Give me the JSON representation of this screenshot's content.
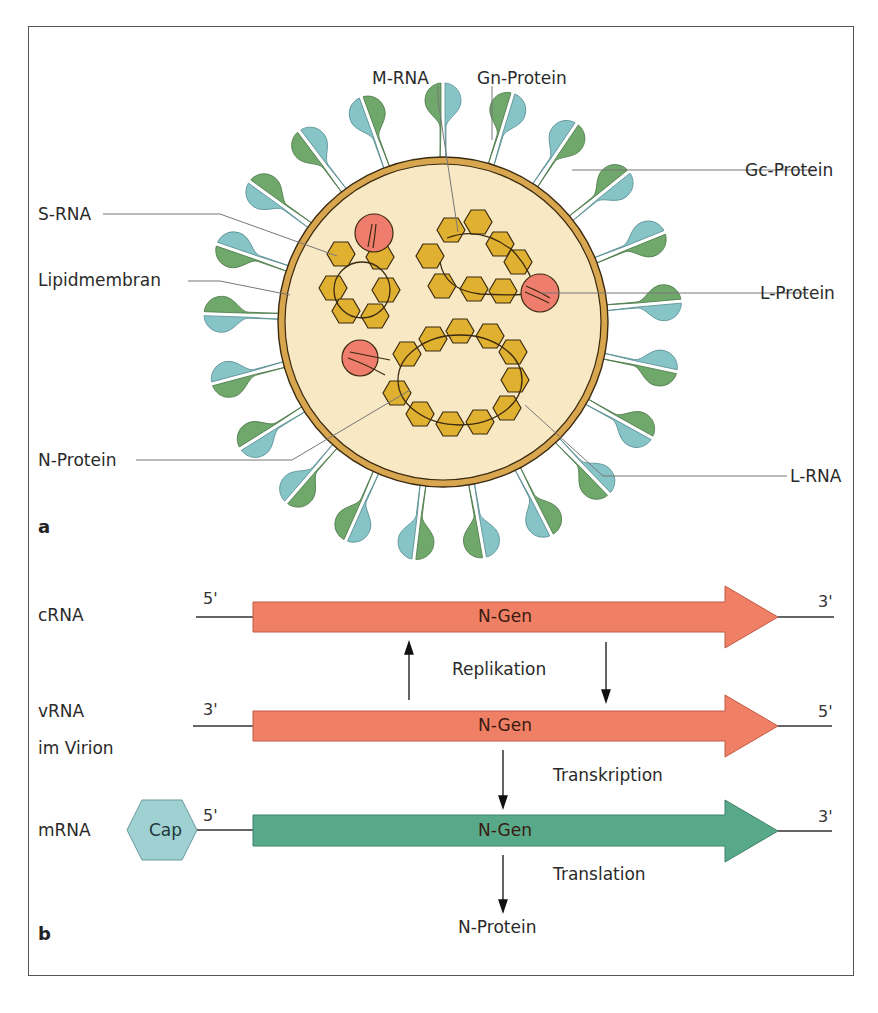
{
  "figure": {
    "colors": {
      "frame": "#555555",
      "virion_interior": "#f8e8c4",
      "membrane": "#d9a650",
      "membrane_edge": "#3a2a10",
      "gn_protein": "#6fa86a",
      "gc_protein": "#86c4c8",
      "nucleocapsid": "#e0b030",
      "l_protein": "#ee7d6e",
      "rna_arrow": "#ef8066",
      "mrna_arrow": "#58a98a",
      "cap": "#9fd0d2",
      "leader_line": "#777777"
    },
    "panel_a": {
      "panel_label": "a",
      "labels": {
        "m_rna": "M-RNA",
        "gn_protein": "Gn-Protein",
        "gc_protein": "Gc-Protein",
        "s_rna": "S-RNA",
        "lipidmembran": "Lipidmembran",
        "l_protein": "L-Protein",
        "n_protein": "N-Protein",
        "l_rna": "L-RNA"
      }
    },
    "panel_b": {
      "panel_label": "b",
      "rows": [
        {
          "name": "cRNA",
          "sub": "",
          "left_end": "5'",
          "right_end": "3'",
          "gene": "N-Gen"
        },
        {
          "name": "vRNA",
          "sub": "im Virion",
          "left_end": "3'",
          "right_end": "5'",
          "gene": "N-Gen"
        },
        {
          "name": "mRNA",
          "sub": "",
          "left_end": "5'",
          "right_end": "3'",
          "gene": "N-Gen"
        }
      ],
      "cap_label": "Cap",
      "processes": {
        "replication": "Replikation",
        "transcription": "Transkription",
        "translation": "Translation"
      },
      "product": "N-Protein"
    }
  }
}
